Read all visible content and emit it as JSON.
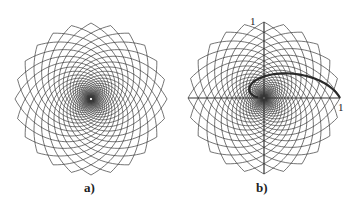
{
  "figures": [
    {
      "id": "a",
      "label": "a)",
      "center": [
        91,
        99
      ],
      "radius": 76,
      "spiral_count": 24,
      "has_axes": false
    },
    {
      "id": "b",
      "label": "b)",
      "center": [
        264,
        98
      ],
      "radius": 76,
      "spiral_count": 24,
      "has_axes": true,
      "axis_labels": {
        "x_end": "1",
        "y_end": "1"
      }
    }
  ],
  "colors": {
    "lines": "#3a3a3a",
    "axes": "#333333",
    "highlight_curve": "#2a2a2a"
  }
}
